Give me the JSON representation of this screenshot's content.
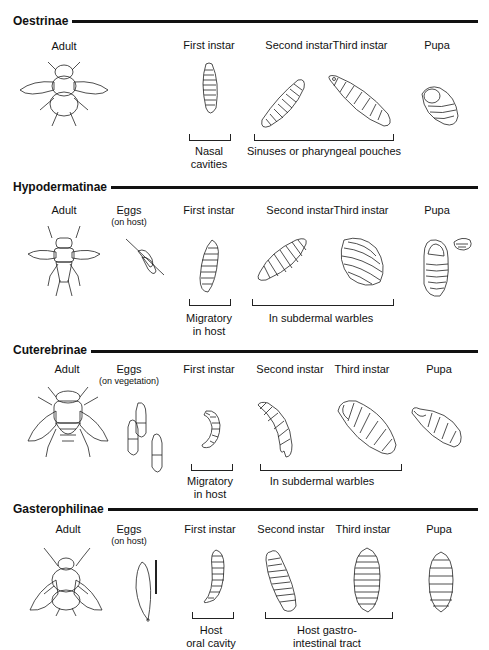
{
  "diagram_title": "Life cycle stages of bot fly subfamilies",
  "sections": [
    {
      "name": "Oestrinae",
      "stages": [
        {
          "label": "Adult"
        },
        {
          "label": "First instar"
        },
        {
          "label": "Second instar"
        },
        {
          "label": "Third instar"
        },
        {
          "label": "Pupa"
        }
      ],
      "locations": [
        {
          "text": "Nasal\ncavities",
          "spans": [
            "First instar"
          ]
        },
        {
          "text": "Sinuses or pharyngeal pouches",
          "spans": [
            "Second instar",
            "Third instar"
          ]
        }
      ]
    },
    {
      "name": "Hypodermatinae",
      "stages": [
        {
          "label": "Adult"
        },
        {
          "label": "Eggs",
          "sublabel": "(on host)"
        },
        {
          "label": "First instar"
        },
        {
          "label": "Second instar"
        },
        {
          "label": "Third instar"
        },
        {
          "label": "Pupa"
        }
      ],
      "locations": [
        {
          "text": "Migratory\nin host",
          "spans": [
            "First instar"
          ]
        },
        {
          "text": "In subdermal warbles",
          "spans": [
            "Second instar",
            "Third instar"
          ]
        }
      ]
    },
    {
      "name": "Cuterebrinae",
      "stages": [
        {
          "label": "Adult"
        },
        {
          "label": "Eggs",
          "sublabel": "(on vegetation)"
        },
        {
          "label": "First instar"
        },
        {
          "label": "Second instar"
        },
        {
          "label": "Third instar"
        },
        {
          "label": "Pupa"
        }
      ],
      "locations": [
        {
          "text": "Migratory\nin host",
          "spans": [
            "First instar"
          ]
        },
        {
          "text": "In subdermal warbles",
          "spans": [
            "Second instar",
            "Third instar"
          ]
        }
      ]
    },
    {
      "name": "Gasterophilinae",
      "stages": [
        {
          "label": "Adult"
        },
        {
          "label": "Eggs",
          "sublabel": "(on host)"
        },
        {
          "label": "First instar"
        },
        {
          "label": "Second instar"
        },
        {
          "label": "Third instar"
        },
        {
          "label": "Pupa"
        }
      ],
      "locations": [
        {
          "text": "Host\noral cavity",
          "spans": [
            "First instar"
          ]
        },
        {
          "text": "Host gastro-\nintestinal tract",
          "spans": [
            "Second instar",
            "Third instar"
          ]
        }
      ]
    }
  ]
}
